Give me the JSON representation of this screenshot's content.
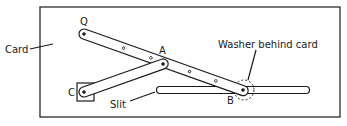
{
  "diagram": {
    "type": "mechanism",
    "labels": {
      "card": "Card",
      "q": "Q",
      "a": "A",
      "b": "B",
      "c": "C",
      "slit": "Slit",
      "washer": "Washer behind card"
    },
    "points": {
      "Q": [
        84,
        34
      ],
      "A": [
        163,
        64
      ],
      "B": [
        243,
        90
      ],
      "C": [
        84,
        92
      ]
    },
    "links": [
      {
        "from": "Q",
        "to": "B",
        "name": "bar-QB"
      },
      {
        "from": "C",
        "to": "A",
        "name": "bar-CA"
      }
    ],
    "slit": {
      "x1": 157,
      "x2": 309,
      "y": 90
    },
    "colors": {
      "line": "#1a1a1a",
      "background": "#ffffff"
    }
  }
}
